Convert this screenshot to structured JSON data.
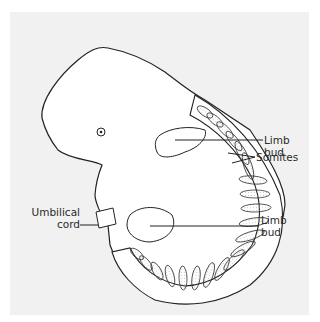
{
  "figure": {
    "background_color": "#f1f1f1",
    "line_color": "#222222",
    "labels": {
      "limb_bud_upper": {
        "line1": "Limb",
        "line2": "bud"
      },
      "somites": "Somites",
      "umbilical_cord": {
        "line1": "Umbilical",
        "line2": "cord"
      },
      "limb_bud_lower": {
        "line1": "Limb",
        "line2": "bud"
      }
    }
  }
}
